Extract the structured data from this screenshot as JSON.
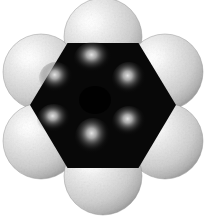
{
  "image": {
    "kind": "space-filling-molecular-model",
    "molecule": "benzene",
    "formula": "C6H6",
    "width": 206,
    "height": 223,
    "background_color": "#ffffff",
    "style": "CPK / calotte model, grayscale photograph",
    "alt_text": "Grayscale space-filling model of benzene: a black hexagonal carbon ring surrounded by six white hydrogen spheres."
  },
  "palette": {
    "background": "#ffffff",
    "carbon_core": "#0a0a0a",
    "carbon_core_deep": "#000000",
    "carbon_highlight": "#d8d8d8",
    "carbon_highlight_core": "#f2f2f2",
    "hydrogen_base": "#d9d9d9",
    "hydrogen_highlight": "#fcfcfc",
    "hydrogen_shadow": "#9a9a9a",
    "hydrogen_rim": "#8c8c8c"
  },
  "ring": {
    "label": "carbon-ring-core",
    "shape": "hexagon",
    "orientation": "flat-top",
    "center": {
      "x": 103,
      "y": 105
    },
    "circumradius": 73,
    "vertices": [
      {
        "x": 67.5,
        "y": 43.0
      },
      {
        "x": 138.5,
        "y": 43.0
      },
      {
        "x": 176.0,
        "y": 105.0
      },
      {
        "x": 138.5,
        "y": 168.0
      },
      {
        "x": 67.5,
        "y": 168.0
      },
      {
        "x": 30.0,
        "y": 105.0
      }
    ],
    "atom_count": 6,
    "atom_symbol": "C"
  },
  "carbon_atoms": [
    {
      "label": "carbon-atom-1",
      "symbol": "C",
      "position": "top",
      "x": 93,
      "y": 58,
      "highlight_radius": 17
    },
    {
      "label": "carbon-atom-2",
      "symbol": "C",
      "position": "upper-right",
      "x": 129,
      "y": 79,
      "highlight_radius": 16
    },
    {
      "label": "carbon-atom-3",
      "symbol": "C",
      "position": "lower-right",
      "x": 129,
      "y": 122,
      "highlight_radius": 16
    },
    {
      "label": "carbon-atom-4",
      "symbol": "C",
      "position": "bottom",
      "x": 93,
      "y": 137,
      "highlight_radius": 17
    },
    {
      "label": "carbon-atom-5",
      "symbol": "C",
      "position": "lower-left",
      "x": 54,
      "y": 119,
      "highlight_radius": 16
    },
    {
      "label": "carbon-atom-6",
      "symbol": "C",
      "position": "upper-left",
      "x": 56,
      "y": 78,
      "highlight_radius": 16
    }
  ],
  "hydrogen_atoms": [
    {
      "label": "hydrogen-atom-top",
      "symbol": "H",
      "x": 103,
      "y": 37,
      "radius": 39
    },
    {
      "label": "hydrogen-atom-upper-right",
      "symbol": "H",
      "x": 165,
      "y": 72,
      "radius": 38
    },
    {
      "label": "hydrogen-atom-lower-right",
      "symbol": "H",
      "x": 165,
      "y": 141,
      "radius": 38
    },
    {
      "label": "hydrogen-atom-bottom",
      "symbol": "H",
      "x": 103,
      "y": 176,
      "radius": 39
    },
    {
      "label": "hydrogen-atom-lower-left",
      "symbol": "H",
      "x": 41,
      "y": 141,
      "radius": 38
    },
    {
      "label": "hydrogen-atom-upper-left",
      "symbol": "H",
      "x": 41,
      "y": 72,
      "radius": 38
    }
  ],
  "lighting": {
    "source": "upper-left",
    "highlight_offset": {
      "dx": -0.32,
      "dy": -0.34
    }
  }
}
